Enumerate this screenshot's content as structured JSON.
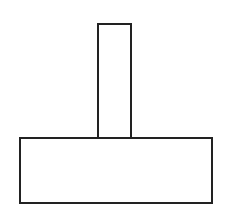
{
  "diagram": {
    "background": "#ffffff",
    "stroke_color": "#222222",
    "stroke_width": 2,
    "shapes": [
      {
        "id": "stem",
        "type": "rect",
        "x": 98,
        "y": 24,
        "width": 33,
        "height": 114
      },
      {
        "id": "base",
        "type": "rect",
        "x": 20,
        "y": 138,
        "width": 192,
        "height": 65
      }
    ]
  }
}
